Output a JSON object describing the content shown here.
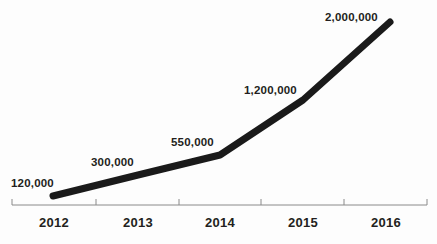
{
  "chart_data": {
    "type": "line",
    "title": "",
    "subtitle": "",
    "xlabel": "",
    "ylabel": "",
    "categories": [
      "2012",
      "2013",
      "2014",
      "2015",
      "2016"
    ],
    "values": [
      120000,
      300000,
      550000,
      1200000,
      2000000
    ],
    "point_labels": [
      "120,000",
      "300,000",
      "550,000",
      "1,200,000",
      "2,000,000"
    ],
    "series": [
      {
        "name": "",
        "values": [
          120000,
          300000,
          550000,
          1200000,
          2000000
        ]
      }
    ],
    "grid": false,
    "legend": false,
    "legend_position": "none",
    "y_axis_visible": false,
    "x_axis_visible": true,
    "ylim": [
      0,
      2000000
    ],
    "line_color": "#1a1a1a",
    "line_width_px": 7,
    "axis_color": "#8a8a8a",
    "label_color": "#231f20",
    "background_color": "#fdfdfd"
  },
  "axis": {
    "tick_positions_px": [
      12,
      96,
      179,
      261,
      344,
      427
    ],
    "baseline_y_px": 205
  },
  "points_px": [
    {
      "x": 53,
      "y": 196
    },
    {
      "x": 138,
      "y": 175
    },
    {
      "x": 220,
      "y": 155
    },
    {
      "x": 303,
      "y": 100
    },
    {
      "x": 390,
      "y": 22
    }
  ]
}
